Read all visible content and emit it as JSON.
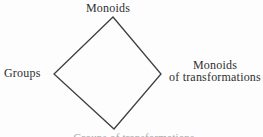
{
  "diagram": {
    "shape": "diamond",
    "top_label": "Monoids",
    "left_label": "Groups",
    "right_label": {
      "line1": "Monoids",
      "line2": "of transformations"
    },
    "bottom_label_clipped": "Groups of transformations",
    "colors": {
      "line": "#3f3f3f",
      "text": "#2f2f2f",
      "background": "#fdfdfd"
    }
  }
}
